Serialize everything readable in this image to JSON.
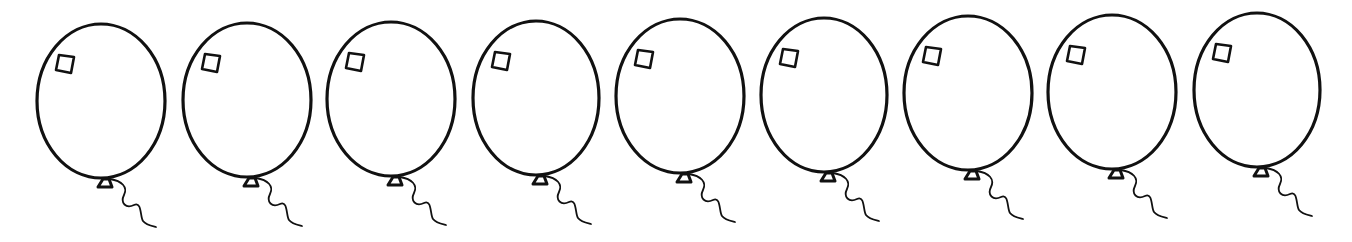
{
  "canvas": {
    "width": 1352,
    "height": 242,
    "background": "#ffffff",
    "stroke": "#111111"
  },
  "balloon_count": 9,
  "balloons": [
    {
      "cx": 101,
      "cy": 101,
      "rx": 64,
      "ry": 77
    },
    {
      "cx": 247,
      "cy": 100,
      "rx": 64,
      "ry": 77
    },
    {
      "cx": 391,
      "cy": 99,
      "rx": 64,
      "ry": 77
    },
    {
      "cx": 536,
      "cy": 98,
      "rx": 63,
      "ry": 77
    },
    {
      "cx": 680,
      "cy": 96,
      "rx": 64,
      "ry": 77
    },
    {
      "cx": 824,
      "cy": 95,
      "rx": 63,
      "ry": 77
    },
    {
      "cx": 968,
      "cy": 93,
      "rx": 64,
      "ry": 77
    },
    {
      "cx": 1112,
      "cy": 92,
      "rx": 64,
      "ry": 77
    },
    {
      "cx": 1257,
      "cy": 90,
      "rx": 63,
      "ry": 77
    }
  ]
}
